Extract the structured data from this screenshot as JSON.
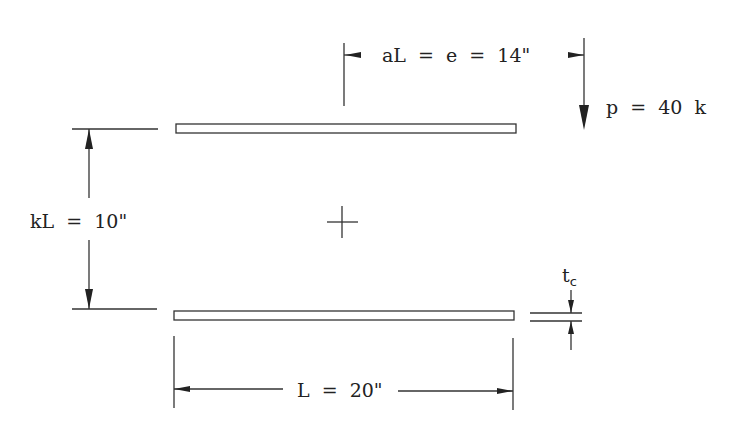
{
  "diagram": {
    "type": "structural-beam-schematic",
    "labels": {
      "eccentricity": "aL  =  e  =  14\"",
      "load": "p  =  40  k",
      "separation": "kL  =  10\"",
      "length": "L  =  20\"",
      "thickness_main": "t",
      "thickness_sub": "c"
    },
    "elements": {
      "top_plate": "upper flange plate",
      "bottom_plate": "lower flange plate",
      "centroid_marker": "centroid cross"
    },
    "values": {
      "a_L": "14\"",
      "e": "14\"",
      "p": "40 k",
      "k_L": "10\"",
      "L": "20\""
    },
    "colors": {
      "line": "#333333",
      "text": "#222222",
      "background": "#ffffff"
    }
  }
}
